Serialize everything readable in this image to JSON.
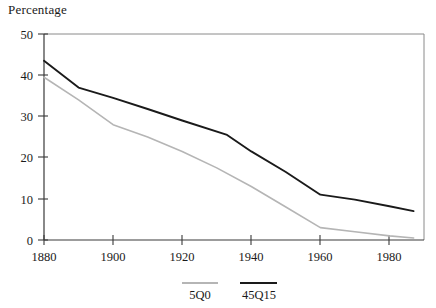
{
  "chart_data": {
    "type": "line",
    "title": "Percentage",
    "xlabel": "",
    "ylabel": "Percentage",
    "xlim": [
      1880,
      1990
    ],
    "ylim": [
      0,
      50
    ],
    "xticks": [
      1880,
      1900,
      1920,
      1940,
      1960,
      1980
    ],
    "yticks": [
      0,
      10,
      20,
      30,
      40,
      50
    ],
    "grid": false,
    "legend_position": "below-axes",
    "series": [
      {
        "name": "5Q0",
        "color": "#b5b5b5",
        "x": [
          1880,
          1890,
          1900,
          1910,
          1920,
          1930,
          1940,
          1950,
          1960,
          1970,
          1980,
          1987
        ],
        "values": [
          39.5,
          34.0,
          28.0,
          25.0,
          21.5,
          17.5,
          13.0,
          8.0,
          3.0,
          2.0,
          1.0,
          0.5
        ]
      },
      {
        "name": "45Q15",
        "color": "#1a1a1a",
        "x": [
          1880,
          1890,
          1900,
          1910,
          1920,
          1933,
          1940,
          1950,
          1960,
          1970,
          1980,
          1987
        ],
        "values": [
          43.5,
          37.0,
          34.5,
          31.8,
          29.0,
          25.5,
          21.5,
          16.5,
          11.0,
          9.8,
          8.2,
          7.0
        ]
      }
    ]
  },
  "legend": {
    "items": [
      {
        "label": "5Q0",
        "color": "#b5b5b5"
      },
      {
        "label": "45Q15",
        "color": "#1a1a1a"
      }
    ]
  },
  "axes": {
    "y_tick_labels": [
      "50",
      "40",
      "30",
      "20",
      "10",
      "0"
    ],
    "x_tick_labels": [
      "1880",
      "1900",
      "1920",
      "1940",
      "1960",
      "1980"
    ]
  }
}
